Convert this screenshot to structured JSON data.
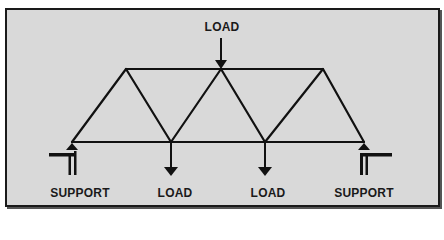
{
  "diagram": {
    "colors": {
      "background": "#d9d9d9",
      "border": "#1a1a1a",
      "stroke": "#111111"
    },
    "labels": {
      "top_load": "LOAD",
      "bottom_load_left": "LOAD",
      "bottom_load_right": "LOAD",
      "support_left": "SUPPORT",
      "support_right": "SUPPORT"
    },
    "nodes": {
      "bottom": [
        [
          72,
          142
        ],
        [
          171,
          142
        ],
        [
          265,
          142
        ],
        [
          364,
          142
        ]
      ],
      "top": [
        [
          126,
          69
        ],
        [
          221,
          69
        ],
        [
          323,
          69
        ]
      ]
    }
  }
}
